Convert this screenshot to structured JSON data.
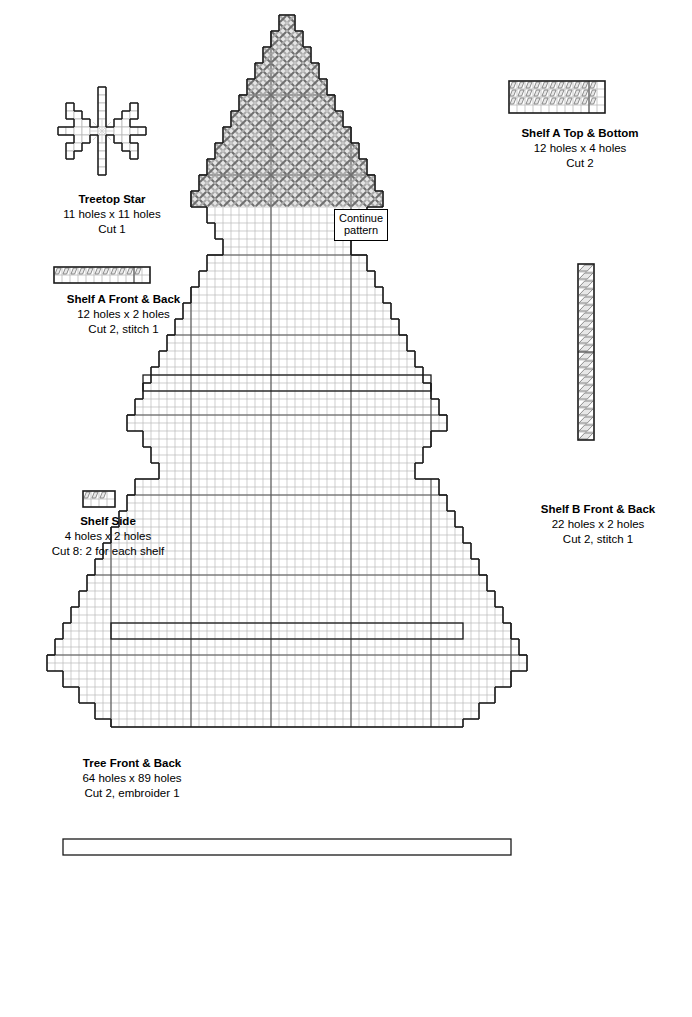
{
  "page": {
    "background": "#ffffff",
    "width": 692,
    "height": 1017
  },
  "style": {
    "cell_px": 8,
    "grid_line_color": "#b9b9b9",
    "major_grid_color": "#555555",
    "outline_color": "#1a1a1a",
    "stitch_color": "#808080",
    "stitch_fill": "#e8e8e8",
    "text_color": "#000000"
  },
  "pieces": [
    {
      "id": "treetop-star",
      "name": "Treetop Star",
      "title": "Treetop Star",
      "sub1": "11 holes x 11 holes",
      "sub2": "Cut 1",
      "sub3": "",
      "cols": 11,
      "rows": 11,
      "x": 57,
      "y": 86,
      "caption_x": 32,
      "caption_y": 192,
      "caption_w": 160,
      "motif": "snowflake"
    },
    {
      "id": "shelf-a-top-bottom",
      "name": "Shelf A Top & Bottom",
      "title": "Shelf A Top & Bottom",
      "sub1": "12 holes x 4 holes",
      "sub2": "Cut 2",
      "sub3": "",
      "cols": 12,
      "rows": 4,
      "x": 508,
      "y": 80,
      "caption_x": 490,
      "caption_y": 126,
      "caption_w": 180,
      "stitch_rows": [
        0,
        1,
        2
      ],
      "stitch_cols": 11,
      "divider_col": 10
    },
    {
      "id": "shelf-a-front-back",
      "name": "Shelf A Front & Back",
      "title": "Shelf A Front & Back",
      "sub1": "12 holes x 2 holes",
      "sub2": "Cut 2, stitch 1",
      "sub3": "",
      "cols": 12,
      "rows": 2,
      "x": 53,
      "y": 266,
      "caption_x": 26,
      "caption_y": 292,
      "caption_w": 195,
      "stitch_rows": [
        0
      ],
      "stitch_cols": 11,
      "divider_col": 10
    },
    {
      "id": "shelf-side",
      "name": "Shelf Side",
      "title": "Shelf Side",
      "sub1": "4 holes x 2 holes",
      "sub2": "Cut 8: 2 for each shelf",
      "sub3": "",
      "cols": 4,
      "rows": 2,
      "x": 82,
      "y": 490,
      "caption_x": 28,
      "caption_y": 514,
      "caption_w": 160,
      "stitch_rows": [
        0
      ],
      "stitch_cols": 3,
      "divider_col": -1
    },
    {
      "id": "shelf-b-front-back",
      "name": "Shelf B Front & Back",
      "title": "Shelf B Front & Back",
      "sub1": "22 holes x 2 holes",
      "sub2": "Cut 2, stitch 1",
      "sub3": "",
      "cols": 2,
      "rows": 22,
      "x": 577,
      "y": 263,
      "caption_x": 508,
      "caption_y": 502,
      "caption_w": 180,
      "vertical": true,
      "stitch_rows_v": 22,
      "divider_row": 11
    },
    {
      "id": "tree-front-back",
      "name": "Tree Front & Back",
      "title": "Tree Front & Back",
      "sub1": "64 holes x 89 holes",
      "sub2": "Cut 2, embroider 1",
      "sub3": "",
      "cols": 64,
      "rows": 89,
      "x": 30,
      "y": 14,
      "caption_x": 42,
      "caption_y": 756,
      "caption_w": 180
    }
  ],
  "annotations": {
    "continue_pattern": {
      "line1": "Continue",
      "line2": "pattern",
      "x": 334,
      "y": 209
    }
  },
  "tree_chart": {
    "description": "Christmas tree shaped plastic canvas chart, 64 holes wide by 89 holes tall. Row spans given as [start_col, end_col_exclusive] in a 64 column grid.",
    "rows": [
      [
        31,
        33
      ],
      [
        31,
        33
      ],
      [
        30,
        34
      ],
      [
        30,
        34
      ],
      [
        29,
        35
      ],
      [
        29,
        35
      ],
      [
        28,
        36
      ],
      [
        28,
        36
      ],
      [
        27,
        37
      ],
      [
        27,
        37
      ],
      [
        26,
        38
      ],
      [
        26,
        38
      ],
      [
        25,
        39
      ],
      [
        25,
        39
      ],
      [
        24,
        40
      ],
      [
        24,
        40
      ],
      [
        23,
        41
      ],
      [
        23,
        41
      ],
      [
        22,
        42
      ],
      [
        22,
        42
      ],
      [
        21,
        43
      ],
      [
        21,
        43
      ],
      [
        20,
        44
      ],
      [
        20,
        44
      ],
      [
        22,
        42
      ],
      [
        22,
        42
      ],
      [
        23,
        41
      ],
      [
        23,
        41
      ],
      [
        24,
        40
      ],
      [
        24,
        40
      ],
      [
        22,
        42
      ],
      [
        22,
        42
      ],
      [
        21,
        43
      ],
      [
        21,
        43
      ],
      [
        20,
        44
      ],
      [
        20,
        44
      ],
      [
        19,
        45
      ],
      [
        19,
        45
      ],
      [
        18,
        46
      ],
      [
        18,
        46
      ],
      [
        17,
        47
      ],
      [
        17,
        47
      ],
      [
        16,
        48
      ],
      [
        16,
        48
      ],
      [
        15,
        49
      ],
      [
        15,
        49
      ],
      [
        14,
        50
      ],
      [
        14,
        50
      ],
      [
        13,
        51
      ],
      [
        13,
        51
      ],
      [
        12,
        52
      ],
      [
        12,
        52
      ],
      [
        14,
        50
      ],
      [
        14,
        50
      ],
      [
        15,
        49
      ],
      [
        15,
        49
      ],
      [
        16,
        48
      ],
      [
        16,
        48
      ],
      [
        13,
        51
      ],
      [
        13,
        51
      ],
      [
        12,
        52
      ],
      [
        12,
        52
      ],
      [
        11,
        53
      ],
      [
        11,
        53
      ],
      [
        10,
        54
      ],
      [
        10,
        54
      ],
      [
        9,
        55
      ],
      [
        9,
        55
      ],
      [
        8,
        56
      ],
      [
        8,
        56
      ],
      [
        7,
        57
      ],
      [
        7,
        57
      ],
      [
        6,
        58
      ],
      [
        6,
        58
      ],
      [
        5,
        59
      ],
      [
        5,
        59
      ],
      [
        4,
        60
      ],
      [
        4,
        60
      ],
      [
        3,
        61
      ],
      [
        3,
        61
      ],
      [
        2,
        62
      ],
      [
        2,
        62
      ],
      [
        4,
        60
      ],
      [
        4,
        60
      ],
      [
        6,
        58
      ],
      [
        6,
        58
      ],
      [
        8,
        56
      ],
      [
        8,
        56
      ],
      [
        10,
        54
      ]
    ],
    "patterned_rows": 24,
    "shelf_slots": [
      {
        "col_start": 14,
        "col_end": 50,
        "row_start": 45,
        "row_end": 47
      },
      {
        "col_start": 10,
        "col_end": 54,
        "row_start": 76,
        "row_end": 78
      },
      {
        "col_start": 4,
        "col_end": 60,
        "row_start": 103,
        "row_end": 105
      }
    ]
  }
}
